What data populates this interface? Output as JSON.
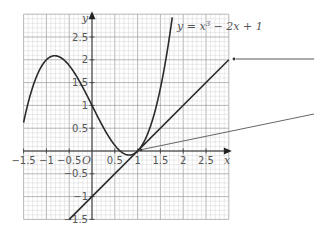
{
  "chart_data": {
    "type": "line",
    "title": "",
    "xlabel": "x",
    "ylabel": "y",
    "origin_label": "O",
    "xlim": [
      -1.5,
      3
    ],
    "ylim": [
      -1.5,
      3
    ],
    "grid": true,
    "x_tick_labels": [
      "−1.5",
      "−1",
      "−0.5",
      "0.5",
      "1",
      "1.5",
      "2",
      "2.5"
    ],
    "x_ticks": [
      -1.5,
      -1,
      -0.5,
      0.5,
      1,
      1.5,
      2,
      2.5
    ],
    "y_tick_labels": [
      "2.5",
      "2",
      "1.5",
      "1",
      "0.5",
      "−0.5",
      "−1",
      "−1.5"
    ],
    "y_ticks": [
      2.5,
      2,
      1.5,
      1,
      0.5,
      -0.5,
      -1,
      -1.5
    ],
    "series": [
      {
        "name": "y = x³ − 2x + 1",
        "kind": "curve",
        "equation": "x^3 - 2x + 1",
        "x": [
          -1.5,
          -1.0,
          -0.816,
          -0.5,
          0,
          0.5,
          0.816,
          1,
          1.5,
          1.9
        ],
        "values": [
          0.625,
          2.0,
          2.089,
          1.875,
          1.0,
          0.125,
          -0.089,
          0.0,
          1.375,
          3.06
        ]
      },
      {
        "name": "tangent line",
        "kind": "line",
        "equation": "x - 1",
        "x": [
          -0.5,
          3
        ],
        "values": [
          -1.5,
          2
        ]
      }
    ],
    "annotations": [
      {
        "text": "y = x³ − 2x + 1",
        "anchor": "curve label near top right of curve"
      },
      {
        "text": "",
        "kind": "label-pointer",
        "target": "tangent line end (3, 2)"
      },
      {
        "text": "",
        "kind": "label-pointer",
        "target": "point of tangency (1, 0)"
      }
    ]
  },
  "labels": {
    "curve_label_prefix": "y = x",
    "curve_label_exp": "3",
    "curve_label_suffix": " − 2x + 1",
    "x_axis": "x",
    "y_axis": "y",
    "origin": "O"
  }
}
